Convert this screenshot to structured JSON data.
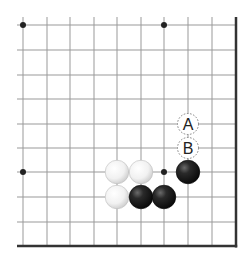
{
  "diagram": {
    "type": "go-board-partial",
    "corner": "bottom-right",
    "columns": 10,
    "rows": 10,
    "x_lines": [
      23,
      47,
      70,
      94,
      117,
      141,
      164,
      188,
      212,
      236
    ],
    "y_lines": [
      25,
      50,
      75,
      99,
      124,
      148,
      172,
      197,
      222,
      246
    ],
    "line_start": {
      "x": 17,
      "y": 17
    },
    "colors": {
      "grid": "#999999",
      "border": "#333333",
      "hoshi": "#222222",
      "black_stone": "#1a1a1a",
      "white_stone": "#f4f4f4",
      "label_text": "#222222"
    },
    "hoshi": [
      {
        "col": 0,
        "row": 0
      },
      {
        "col": 6,
        "row": 0
      },
      {
        "col": 0,
        "row": 6
      },
      {
        "col": 6,
        "row": 6
      }
    ],
    "stones": [
      {
        "color": "white",
        "col": 4,
        "row": 6
      },
      {
        "color": "white",
        "col": 5,
        "row": 6
      },
      {
        "color": "white",
        "col": 4,
        "row": 7
      },
      {
        "color": "black",
        "col": 5,
        "row": 7
      },
      {
        "color": "black",
        "col": 6,
        "row": 7
      },
      {
        "color": "black",
        "col": 7,
        "row": 6
      }
    ],
    "labels": [
      {
        "text": "A",
        "col": 7,
        "row": 4
      },
      {
        "text": "B",
        "col": 7,
        "row": 5
      }
    ]
  }
}
